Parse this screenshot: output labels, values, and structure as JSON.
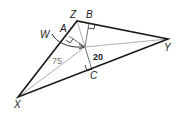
{
  "diagram": {
    "type": "triangle-incenter",
    "vertices": {
      "X": {
        "label": "X",
        "x": 18,
        "y": 97
      },
      "Y": {
        "label": "Y",
        "x": 168,
        "y": 39
      },
      "Z": {
        "label": "Z",
        "x": 77,
        "y": 21
      }
    },
    "incenter": {
      "label": "W",
      "x": 85,
      "y": 47
    },
    "feet": {
      "A": {
        "label": "A",
        "on": "XZ"
      },
      "B": {
        "label": "B",
        "on": "ZY"
      },
      "C": {
        "label": "C",
        "on": "XY"
      }
    },
    "measures": {
      "XW": "75",
      "WC": "20"
    },
    "colors": {
      "triangle": "#1a1a1a",
      "inner_lines": "#888888",
      "labels": "#1a1a1a"
    }
  }
}
